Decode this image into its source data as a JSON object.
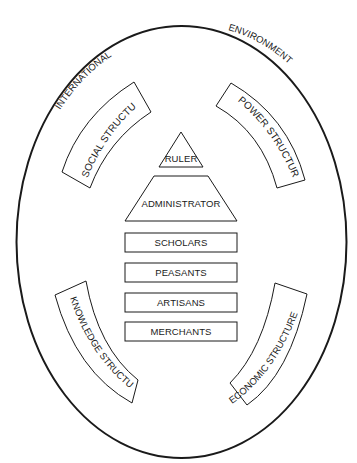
{
  "diagram": {
    "environment": {
      "left_label": "INTERNATIONAL",
      "right_label": "ENVIRONMENT"
    },
    "structures": [
      {
        "id": "social",
        "label": "SOCIAL  STRUCTURE",
        "position": "upper-left"
      },
      {
        "id": "power",
        "label": "POWER  STRUCTURE",
        "position": "upper-right"
      },
      {
        "id": "knowledge",
        "label": "KNOWLEDGE STRUCTURE",
        "position": "lower-left"
      },
      {
        "id": "economic",
        "label": "ECONOMIC STRUCTURE",
        "position": "lower-right"
      }
    ],
    "hierarchy": [
      {
        "id": "ruler",
        "label": "RULER",
        "shape": "triangle"
      },
      {
        "id": "administrator",
        "label": "ADMINISTRATOR",
        "shape": "trapezoid"
      },
      {
        "id": "scholars",
        "label": "SCHOLARS",
        "shape": "rectangle"
      },
      {
        "id": "peasants",
        "label": "PEASANTS",
        "shape": "rectangle"
      },
      {
        "id": "artisans",
        "label": "ARTISANS",
        "shape": "rectangle"
      },
      {
        "id": "merchants",
        "label": "MERCHANTS",
        "shape": "rectangle"
      }
    ],
    "colors": {
      "stroke": "#1a1a1a",
      "background": "#ffffff"
    }
  }
}
